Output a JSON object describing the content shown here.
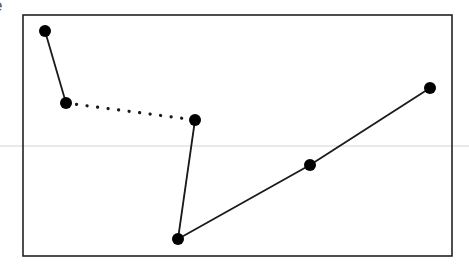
{
  "diagram": {
    "clipped_label": "e",
    "guide_line": {
      "y": 146,
      "color": "#e2e2e2"
    },
    "frame": {
      "x": 23,
      "y": 15,
      "width": 429,
      "height": 241,
      "stroke": "#222222"
    },
    "points": [
      {
        "id": "p1",
        "x": 45,
        "y": 31
      },
      {
        "id": "p2",
        "x": 66,
        "y": 103
      },
      {
        "id": "p3",
        "x": 195,
        "y": 120
      },
      {
        "id": "p4",
        "x": 178,
        "y": 239
      },
      {
        "id": "p5",
        "x": 310,
        "y": 165
      },
      {
        "id": "p6",
        "x": 430,
        "y": 88
      }
    ],
    "edges": [
      {
        "from": "p1",
        "to": "p2",
        "style": "solid"
      },
      {
        "from": "p2",
        "to": "p3",
        "style": "dotted"
      },
      {
        "from": "p3",
        "to": "p4",
        "style": "solid"
      },
      {
        "from": "p4",
        "to": "p5",
        "style": "solid"
      },
      {
        "from": "p5",
        "to": "p6",
        "style": "solid"
      }
    ],
    "point_radius": 6,
    "point_color": "#000000",
    "edge_color": "#1a1a1a"
  }
}
